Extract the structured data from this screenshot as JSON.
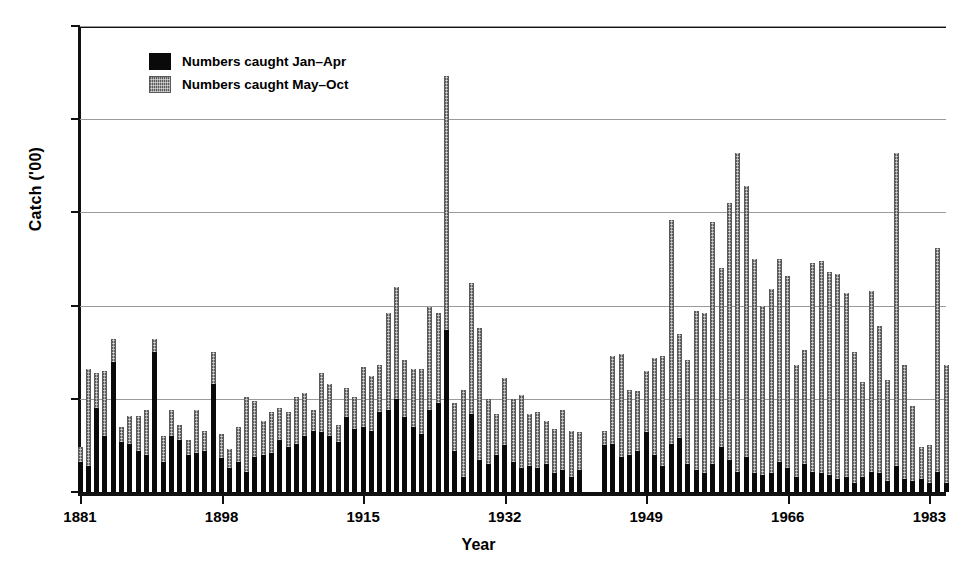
{
  "chart_data": {
    "type": "bar",
    "stacked": true,
    "title": "",
    "xlabel": "Year",
    "ylabel": "Catch ('00)",
    "ylim": [
      0,
      25
    ],
    "yticks": [
      0,
      5,
      10,
      15,
      20,
      25
    ],
    "xlim": [
      1881,
      1985
    ],
    "xticks": [
      1881,
      1898,
      1915,
      1932,
      1949,
      1966,
      1983
    ],
    "grid": "horizontal",
    "legend_position": "top-left",
    "colors": {
      "jan_apr": "#0a0a0a",
      "may_oct": "#8d8d8d",
      "gridline": "#9a9a9a",
      "axis": "#111111"
    },
    "legend": [
      {
        "key": "jan_apr",
        "label": "Numbers caught Jan–Apr",
        "swatch": "black"
      },
      {
        "key": "may_oct",
        "label": "Numbers caught May–Oct",
        "swatch": "gray"
      }
    ],
    "series": [
      {
        "name": "Numbers caught Jan–Apr",
        "key": "jan_apr"
      },
      {
        "name": "Numbers caught May–Oct",
        "key": "may_oct"
      }
    ],
    "x": [
      1881,
      1882,
      1883,
      1884,
      1885,
      1886,
      1887,
      1888,
      1889,
      1890,
      1891,
      1892,
      1893,
      1894,
      1895,
      1896,
      1897,
      1898,
      1899,
      1900,
      1901,
      1902,
      1903,
      1904,
      1905,
      1906,
      1907,
      1908,
      1909,
      1910,
      1911,
      1912,
      1913,
      1914,
      1915,
      1916,
      1917,
      1918,
      1919,
      1920,
      1921,
      1922,
      1923,
      1924,
      1925,
      1926,
      1927,
      1928,
      1929,
      1930,
      1931,
      1932,
      1933,
      1934,
      1935,
      1936,
      1937,
      1938,
      1939,
      1940,
      1941,
      1942,
      1943,
      1944,
      1945,
      1946,
      1947,
      1948,
      1949,
      1950,
      1951,
      1952,
      1953,
      1954,
      1955,
      1956,
      1957,
      1958,
      1959,
      1960,
      1961,
      1962,
      1963,
      1964,
      1965,
      1966,
      1967,
      1968,
      1969,
      1970,
      1971,
      1972,
      1973,
      1974,
      1975,
      1976,
      1977,
      1978,
      1979,
      1980,
      1981,
      1982,
      1983,
      1984,
      1985
    ],
    "jan_apr": [
      1.6,
      1.4,
      4.5,
      3.0,
      7.0,
      2.7,
      2.6,
      2.2,
      2.0,
      7.5,
      1.6,
      3.0,
      2.8,
      2.0,
      2.1,
      2.2,
      5.8,
      1.8,
      1.3,
      1.6,
      1.1,
      1.9,
      2.0,
      2.1,
      2.8,
      2.4,
      2.6,
      3.0,
      3.3,
      3.2,
      3.0,
      2.7,
      4.0,
      3.4,
      3.5,
      3.3,
      4.3,
      4.4,
      5.0,
      4.0,
      3.5,
      3.1,
      4.4,
      4.8,
      8.7,
      2.2,
      0.8,
      4.2,
      1.7,
      1.5,
      2.0,
      2.5,
      1.6,
      1.3,
      1.4,
      1.3,
      1.5,
      1.0,
      1.2,
      0.8,
      1.2,
      0,
      0,
      2.5,
      2.6,
      1.9,
      2.0,
      2.2,
      3.2,
      2.0,
      1.4,
      2.6,
      2.9,
      1.5,
      1.2,
      1.0,
      1.5,
      2.4,
      1.7,
      1.1,
      1.9,
      1.0,
      0.9,
      1.0,
      1.6,
      1.3,
      0.8,
      1.5,
      1.1,
      1.0,
      0.9,
      0.7,
      0.8,
      0.5,
      0.8,
      1.1,
      1.0,
      0.6,
      1.4,
      0.7,
      0.6,
      0.7,
      0.5,
      1.1,
      0.5,
      0.6
    ],
    "may_oct": [
      0.8,
      5.2,
      1.9,
      3.5,
      1.2,
      0.8,
      1.5,
      1.9,
      2.4,
      0.7,
      1.4,
      1.4,
      0.8,
      0.8,
      2.3,
      1.1,
      1.7,
      1.3,
      1.0,
      1.9,
      4.0,
      3.0,
      1.8,
      2.2,
      1.7,
      1.9,
      2.5,
      2.3,
      1.1,
      3.2,
      2.8,
      0.9,
      1.6,
      1.7,
      3.2,
      2.9,
      2.5,
      5.2,
      6.0,
      3.1,
      3.1,
      3.5,
      5.5,
      4.8,
      13.6,
      2.6,
      4.7,
      7.0,
      7.1,
      3.5,
      2.2,
      3.6,
      3.4,
      3.9,
      2.8,
      3.0,
      2.3,
      2.4,
      3.2,
      2.5,
      2.0,
      0,
      0,
      0.8,
      4.7,
      5.5,
      3.5,
      3.2,
      3.3,
      5.2,
      5.9,
      12.0,
      5.6,
      5.6,
      8.5,
      8.6,
      13.0,
      9.6,
      13.8,
      17.1,
      14.5,
      11.5,
      9.1,
      9.9,
      10.9,
      10.3,
      6.0,
      6.1,
      11.2,
      11.4,
      10.9,
      11.0,
      9.9,
      7.0,
      5.1,
      9.7,
      7.9,
      5.4,
      16.8,
      6.1,
      4.0,
      1.7,
      2.0,
      12.0,
      6.3,
      5.2
    ],
    "totals": [
      2.4,
      6.6,
      6.4,
      6.5,
      8.2,
      3.5,
      4.1,
      4.1,
      4.4,
      8.2,
      3.0,
      4.4,
      3.6,
      2.8,
      4.4,
      3.3,
      7.5,
      3.1,
      2.3,
      3.5,
      5.1,
      4.9,
      3.8,
      4.3,
      4.5,
      4.3,
      5.1,
      5.3,
      4.4,
      6.4,
      5.8,
      3.6,
      5.6,
      5.1,
      6.7,
      6.2,
      6.8,
      9.6,
      11.0,
      7.1,
      6.6,
      6.6,
      9.9,
      9.6,
      22.3,
      4.8,
      5.5,
      11.2,
      8.8,
      5.0,
      4.2,
      6.1,
      5.0,
      5.2,
      4.2,
      4.3,
      3.8,
      3.4,
      4.4,
      3.3,
      3.2,
      0,
      0,
      3.3,
      7.3,
      7.4,
      5.5,
      5.4,
      6.5,
      7.2,
      7.3,
      14.6,
      8.5,
      7.1,
      9.7,
      9.6,
      14.5,
      12.0,
      15.5,
      18.2,
      16.4,
      12.5,
      10.0,
      10.9,
      12.5,
      11.6,
      6.8,
      7.6,
      12.3,
      12.4,
      11.8,
      11.7,
      10.7,
      7.5,
      5.9,
      10.8,
      8.9,
      6.0,
      18.2,
      6.8,
      4.6,
      2.4,
      2.5,
      13.1,
      6.8,
      5.8
    ]
  }
}
